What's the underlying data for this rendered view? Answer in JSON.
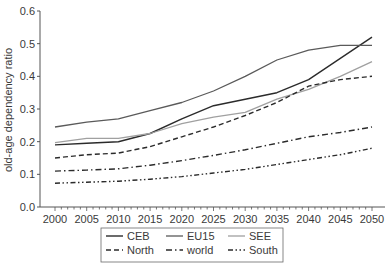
{
  "chart_data": {
    "type": "line",
    "title": "",
    "xlabel": "",
    "ylabel": "old-age dependency ratio",
    "x": [
      2000,
      2005,
      2010,
      2015,
      2020,
      2025,
      2030,
      2035,
      2040,
      2045,
      2050
    ],
    "xticks": [
      "2000",
      "2005",
      "2010",
      "2015",
      "2020",
      "2025",
      "2030",
      "2035",
      "2040",
      "2045",
      "2050"
    ],
    "yticks": [
      "0.0",
      "0.1",
      "0.2",
      "0.3",
      "0.4",
      "0.5",
      "0.6"
    ],
    "ylim": [
      0,
      0.6
    ],
    "grid": false,
    "legend_position": "bottom",
    "series": [
      {
        "name": "CEB",
        "style": "solid",
        "color": "#2b2b2b",
        "width": 1.4,
        "values": [
          0.19,
          0.195,
          0.2,
          0.225,
          0.27,
          0.31,
          0.33,
          0.35,
          0.39,
          0.455,
          0.52
        ]
      },
      {
        "name": "EU15",
        "style": "solid",
        "color": "#5a5a5a",
        "width": 1.3,
        "values": [
          0.245,
          0.26,
          0.27,
          0.295,
          0.32,
          0.355,
          0.4,
          0.45,
          0.48,
          0.495,
          0.495
        ]
      },
      {
        "name": "SEE",
        "style": "solid",
        "color": "#a0a0a0",
        "width": 1.3,
        "values": [
          0.197,
          0.21,
          0.21,
          0.225,
          0.255,
          0.275,
          0.29,
          0.33,
          0.36,
          0.4,
          0.445
        ]
      },
      {
        "name": "North",
        "style": "dashed",
        "color": "#2b2b2b",
        "width": 1.4,
        "values": [
          0.15,
          0.16,
          0.165,
          0.185,
          0.215,
          0.245,
          0.28,
          0.32,
          0.37,
          0.39,
          0.4
        ]
      },
      {
        "name": "world",
        "style": "dash-dot",
        "color": "#2b2b2b",
        "width": 1.4,
        "values": [
          0.11,
          0.113,
          0.117,
          0.128,
          0.142,
          0.158,
          0.175,
          0.195,
          0.215,
          0.228,
          0.245
        ]
      },
      {
        "name": "South",
        "style": "dash-dot-dot",
        "color": "#2b2b2b",
        "width": 1.4,
        "values": [
          0.073,
          0.076,
          0.079,
          0.085,
          0.093,
          0.104,
          0.115,
          0.13,
          0.145,
          0.16,
          0.18
        ]
      }
    ]
  }
}
